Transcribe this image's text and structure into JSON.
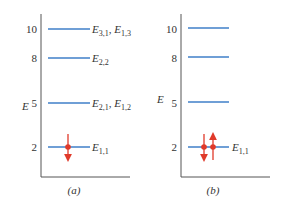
{
  "colors": {
    "level": "#6f9fd6",
    "electron": "#e03a2a",
    "axis": "#555555"
  },
  "panels": [
    {
      "caption": "(a)",
      "axis_label": "E",
      "levels": [
        {
          "energy": "10",
          "label_main": "E",
          "label_sub1": "3,1",
          "sep": ", ",
          "label_main2": "E",
          "label_sub2": "1,3"
        },
        {
          "energy": "8",
          "label_main": "E",
          "label_sub1": "2,2"
        },
        {
          "energy": "5",
          "label_main": "E",
          "label_sub1": "2,1",
          "sep": ", ",
          "label_main2": "E",
          "label_sub2": "1,2"
        },
        {
          "energy": "2",
          "label_main": "E",
          "label_sub1": "1,1"
        }
      ],
      "electrons": [
        "spin-down"
      ]
    },
    {
      "caption": "(b)",
      "axis_label": "E",
      "levels": [
        {
          "energy": "10"
        },
        {
          "energy": "8"
        },
        {
          "energy": "5"
        },
        {
          "energy": "2",
          "label_main": "E",
          "label_sub1": "1,1"
        }
      ],
      "electrons": [
        "spin-down",
        "spin-up"
      ]
    }
  ]
}
